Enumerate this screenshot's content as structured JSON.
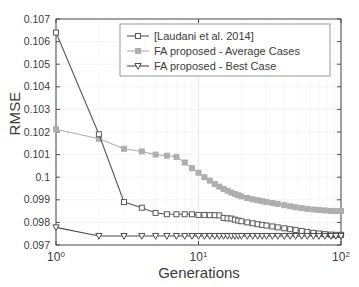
{
  "chart_data": {
    "type": "line",
    "title": "",
    "xlabel": "Generations",
    "ylabel": "RMSE",
    "xscale": "log",
    "yscale": "linear",
    "xlim": [
      1,
      100
    ],
    "ylim": [
      0.097,
      0.107
    ],
    "grid": true,
    "legend_position": "top-right",
    "xticks": [
      1,
      10,
      100
    ],
    "xticklabels": [
      "10^0",
      "10^1",
      "10^2"
    ],
    "yticks": [
      0.097,
      0.098,
      0.099,
      0.1,
      0.101,
      0.102,
      0.103,
      0.104,
      0.105,
      0.106,
      0.107
    ],
    "yticklabels": [
      "0.097",
      "0.098",
      "0.099",
      "0.1",
      "0.101",
      "0.102",
      "0.103",
      "0.104",
      "0.105",
      "0.106",
      "0.107"
    ],
    "x": [
      1,
      2,
      3,
      4,
      5,
      6,
      7,
      8,
      9,
      10,
      11,
      12,
      13,
      14,
      15,
      16,
      17,
      18,
      19,
      20,
      22,
      24,
      26,
      28,
      30,
      33,
      36,
      40,
      44,
      48,
      53,
      58,
      64,
      70,
      77,
      85,
      92,
      100
    ],
    "series": [
      {
        "name": "[Laudani et al. 2014]",
        "marker": "square",
        "color": "#595959",
        "values": [
          0.1064,
          0.1019,
          0.0989,
          0.09865,
          0.09842,
          0.09836,
          0.09836,
          0.09836,
          0.09836,
          0.09833,
          0.09833,
          0.09832,
          0.09832,
          0.09831,
          0.0982,
          0.09818,
          0.09817,
          0.09812,
          0.09808,
          0.09805,
          0.098,
          0.09796,
          0.09792,
          0.09789,
          0.09786,
          0.09782,
          0.09778,
          0.09774,
          0.0977,
          0.09766,
          0.09762,
          0.09758,
          0.09754,
          0.09751,
          0.09748,
          0.09746,
          0.09745,
          0.09745
        ]
      },
      {
        "name": "FA proposed - Average Cases",
        "marker": "square-filled",
        "color": "#aeaeae",
        "values": [
          0.10212,
          0.1017,
          0.10126,
          0.10114,
          0.101,
          0.10095,
          0.1009,
          0.10065,
          0.1004,
          0.1002,
          0.1,
          0.09985,
          0.0997,
          0.09958,
          0.09948,
          0.0994,
          0.09932,
          0.09926,
          0.0992,
          0.09915,
          0.09908,
          0.09902,
          0.09898,
          0.09894,
          0.0989,
          0.09886,
          0.09882,
          0.09876,
          0.09871,
          0.09867,
          0.09863,
          0.0986,
          0.09857,
          0.09855,
          0.09853,
          0.09851,
          0.0985,
          0.0985
        ]
      },
      {
        "name": "FA proposed - Best Case",
        "marker": "triangle-down",
        "color": "#4a4a4a",
        "values": [
          0.09778,
          0.0974,
          0.0974,
          0.0974,
          0.0974,
          0.0974,
          0.0974,
          0.0974,
          0.0974,
          0.0974,
          0.0974,
          0.0974,
          0.0974,
          0.0974,
          0.0974,
          0.0974,
          0.0974,
          0.0974,
          0.0974,
          0.0974,
          0.0974,
          0.0974,
          0.0974,
          0.0974,
          0.0974,
          0.0974,
          0.0974,
          0.0974,
          0.0974,
          0.0974,
          0.0974,
          0.0974,
          0.0974,
          0.0974,
          0.0974,
          0.0974,
          0.0974,
          0.0974
        ]
      }
    ]
  },
  "axes": {
    "xlabel": "Generations",
    "ylabel": "RMSE"
  },
  "legend": {
    "items": [
      {
        "label": "[Laudani et al. 2014]"
      },
      {
        "label": "FA proposed - Average Cases"
      },
      {
        "label": "FA proposed - Best Case"
      }
    ]
  }
}
